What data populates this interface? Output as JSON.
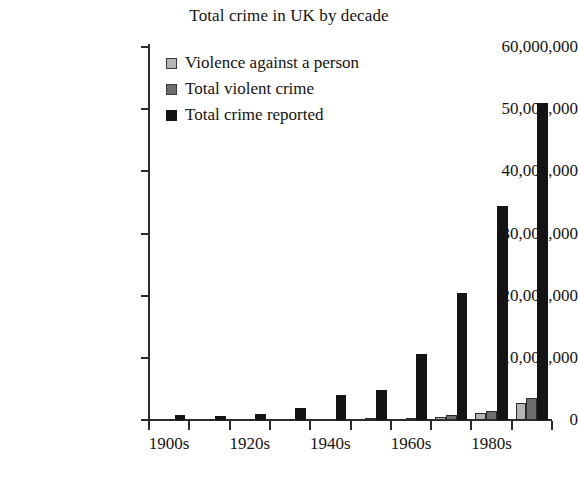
{
  "chart_data": {
    "type": "bar",
    "title": "Total crime in UK by decade",
    "xlabel": "",
    "ylabel": "",
    "ylim": [
      0,
      60000000
    ],
    "ytick_values": [
      0,
      10000000,
      20000000,
      30000000,
      40000000,
      50000000,
      60000000
    ],
    "ytick_labels": [
      "0",
      "10,000,000",
      "20,000,000",
      "30,000,000",
      "40,000,000",
      "50,000,000",
      "60,000,000"
    ],
    "grid": false,
    "legend_position": "upper-left-inside",
    "categories": [
      "1900s",
      "1910s",
      "1920s",
      "1930s",
      "1940s",
      "1950s",
      "1960s",
      "1970s",
      "1980s",
      "1990s"
    ],
    "xtick_labels_visible": [
      "1900s",
      "",
      "1920s",
      "",
      "1940s",
      "",
      "1960s",
      "",
      "1980s",
      ""
    ],
    "series": [
      {
        "name": "Violence against a person",
        "color": "#b4b4b4",
        "values": [
          0,
          0,
          0,
          0,
          0,
          0,
          0,
          500000,
          1100000,
          2800000
        ]
      },
      {
        "name": "Total violent crime",
        "color": "#6e6e6e",
        "values": [
          0,
          0,
          0,
          0,
          0,
          200000,
          300000,
          800000,
          1500000,
          3600000
        ]
      },
      {
        "name": "Total crime reported",
        "color": "#141414",
        "values": [
          800000,
          700000,
          1000000,
          1900000,
          4100000,
          4900000,
          10600000,
          20500000,
          34500000,
          51000000
        ]
      }
    ]
  }
}
